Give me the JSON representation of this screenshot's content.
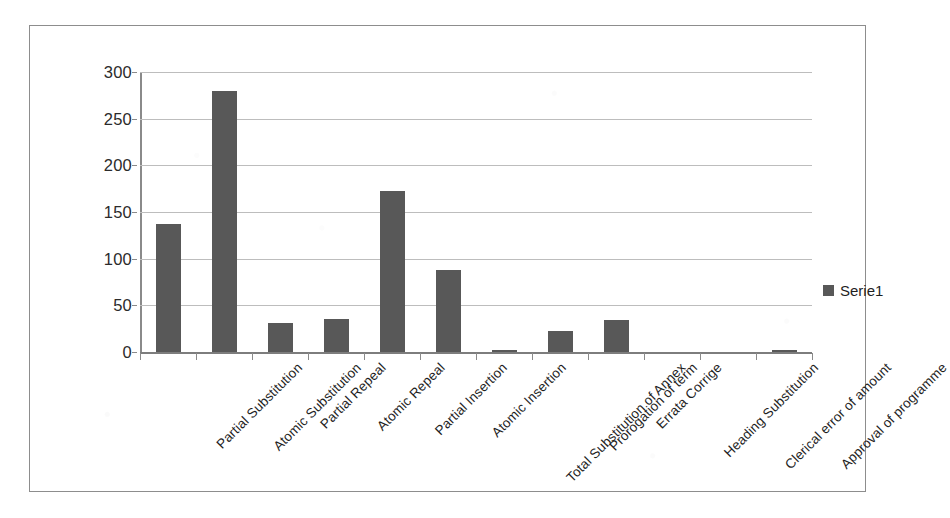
{
  "chart_data": {
    "type": "bar",
    "title": "",
    "xlabel": "",
    "ylabel": "",
    "ylim": [
      0,
      300
    ],
    "yticks": [
      0,
      50,
      100,
      150,
      200,
      250,
      300
    ],
    "ytick_labels": [
      "0",
      "50",
      "100",
      "150",
      "200",
      "250",
      "300"
    ],
    "grid": true,
    "legend_position": "right",
    "categories": [
      "Partial Substitution",
      "Atomic Substitution",
      "Partial Repeal",
      "Atomic Repeal",
      "Partial Insertion",
      "Atomic Insertion",
      "Total Substitution of Annex",
      "Prorogation of term",
      "Errata Corrige",
      "Heading Substitution",
      "Clerical error of amount",
      "Approval of programme"
    ],
    "series": [
      {
        "name": "Serie1",
        "color": "#585858",
        "values": [
          137,
          280,
          31,
          35,
          172,
          88,
          1,
          23,
          34,
          0,
          0,
          2
        ]
      }
    ]
  },
  "legend": {
    "entries": [
      {
        "label": "Serie1",
        "swatch_name": "legend-swatch-serie1"
      }
    ]
  },
  "style": {
    "bar_color": "#585858",
    "gridline_color": "#bdbdbd",
    "axis_color": "#8a8a8a",
    "border_color": "#8d8d8d",
    "background_color": "#ffffff",
    "text_color": "#1f1f1f"
  }
}
